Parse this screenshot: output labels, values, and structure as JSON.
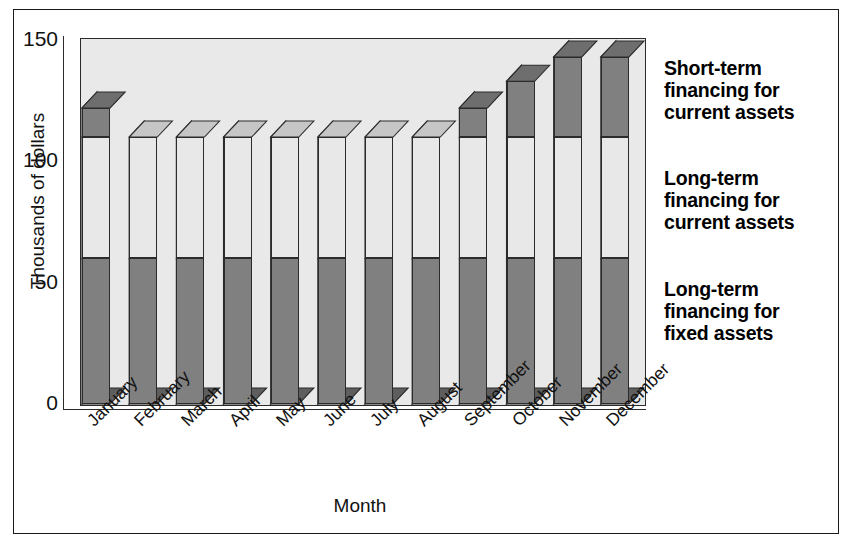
{
  "chart_data": {
    "type": "bar",
    "subtype": "stacked-3d-column",
    "title": "",
    "xlabel": "Month",
    "ylabel": "Thousands of dollars",
    "ylim": [
      0,
      150
    ],
    "yticks": [
      0,
      50,
      100,
      150
    ],
    "grid": false,
    "legend_position": "right",
    "categories": [
      "January",
      "February",
      "March",
      "April",
      "May",
      "June",
      "July",
      "August",
      "September",
      "October",
      "November",
      "December"
    ],
    "series": [
      {
        "name": "Long-term financing for fixed assets",
        "color": "#808080",
        "values": [
          60,
          60,
          60,
          60,
          60,
          60,
          60,
          60,
          60,
          60,
          60,
          60
        ]
      },
      {
        "name": "Long-term financing for current assets",
        "color": "#e8e8e8",
        "values": [
          50,
          50,
          50,
          50,
          50,
          50,
          50,
          50,
          50,
          50,
          50,
          50
        ]
      },
      {
        "name": "Short-term financing for current assets",
        "color": "#808080",
        "values": [
          12,
          0,
          0,
          0,
          0,
          0,
          0,
          0,
          12,
          23,
          33,
          33
        ]
      }
    ],
    "totals": [
      122,
      110,
      110,
      110,
      110,
      110,
      110,
      110,
      122,
      133,
      143,
      143
    ]
  },
  "axis": {
    "ylabel": "Thousands of dollars",
    "xlabel": "Month",
    "ytick_labels": [
      "150",
      "100",
      "50",
      "0"
    ]
  },
  "legend": {
    "entries": [
      {
        "line1": "Short-term",
        "line2": "financing for",
        "line3": "current assets"
      },
      {
        "line1": "Long-term",
        "line2": "financing for",
        "line3": "current assets"
      },
      {
        "line1": "Long-term",
        "line2": "financing for",
        "line3": "fixed assets"
      }
    ]
  },
  "colors": {
    "dark_fill": "#808080",
    "dark_side": "#5e5e5e",
    "dark_top": "#6e6e6e",
    "light_fill": "#ececec",
    "light_side": "#c6c6c6",
    "plot_background": "#e9e9e9",
    "line": "#2b2b2b"
  }
}
